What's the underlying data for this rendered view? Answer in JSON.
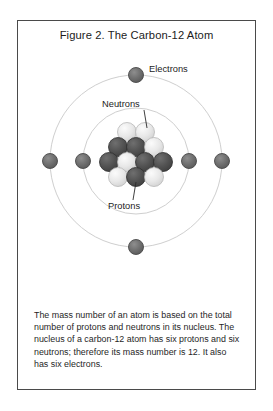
{
  "figure": {
    "title": "Figure 2. The Carbon-12 Atom",
    "caption": "The mass number of an atom is based on the total number of protons and neutrons in its nucleus. The nucleus of a carbon-12 atom has six protons and six neutrons; therefore its mass number is 12. It also has six electrons.",
    "border_color": "#4a4a4a",
    "background_color": "#ffffff"
  },
  "labels": {
    "electrons": "Electrons",
    "neutrons": "Neutrons",
    "protons": "Protons"
  },
  "colors": {
    "orbit_ring": "#cfcfcf",
    "electron": "#6b6b6b",
    "proton": "#4f4f4f",
    "neutron": "#e2e2e2",
    "text": "#1c1c1c",
    "leader_line": "#2b2b2b"
  },
  "atom": {
    "center": {
      "x": 118,
      "y": 112
    },
    "orbits": [
      {
        "name": "inner-orbit",
        "radius": 53
      },
      {
        "name": "outer-orbit",
        "radius": 86
      }
    ],
    "electron_count": 6,
    "proton_count": 6,
    "neutron_count": 6,
    "electrons": [
      {
        "name": "electron-outer-top",
        "x": 118,
        "y": 26,
        "r": 7.5
      },
      {
        "name": "electron-outer-bottom",
        "x": 118,
        "y": 198,
        "r": 7.5
      },
      {
        "name": "electron-outer-left",
        "x": 32,
        "y": 112,
        "r": 7.5
      },
      {
        "name": "electron-outer-right",
        "x": 204,
        "y": 112,
        "r": 7.5
      },
      {
        "name": "electron-inner-left",
        "x": 65,
        "y": 112,
        "r": 7.5
      },
      {
        "name": "electron-inner-right",
        "x": 171,
        "y": 112,
        "r": 7.5
      }
    ],
    "nucleus_particles": [
      {
        "name": "neutron",
        "x": 109,
        "y": 83,
        "r": 9.5,
        "type": "neutron"
      },
      {
        "name": "neutron",
        "x": 127,
        "y": 83,
        "r": 9.5,
        "type": "neutron"
      },
      {
        "name": "proton",
        "x": 100,
        "y": 98,
        "r": 9.5,
        "type": "proton"
      },
      {
        "name": "proton",
        "x": 118,
        "y": 98,
        "r": 9.5,
        "type": "proton"
      },
      {
        "name": "neutron",
        "x": 136,
        "y": 98,
        "r": 9.5,
        "type": "neutron"
      },
      {
        "name": "proton",
        "x": 91,
        "y": 113,
        "r": 9.5,
        "type": "proton"
      },
      {
        "name": "neutron",
        "x": 109,
        "y": 113,
        "r": 9.5,
        "type": "neutron"
      },
      {
        "name": "proton",
        "x": 127,
        "y": 113,
        "r": 9.5,
        "type": "proton"
      },
      {
        "name": "proton",
        "x": 145,
        "y": 113,
        "r": 9.5,
        "type": "proton"
      },
      {
        "name": "neutron",
        "x": 100,
        "y": 128,
        "r": 9.5,
        "type": "neutron"
      },
      {
        "name": "proton",
        "x": 118,
        "y": 128,
        "r": 9.5,
        "type": "proton"
      },
      {
        "name": "neutron",
        "x": 136,
        "y": 128,
        "r": 9.5,
        "type": "neutron"
      }
    ]
  }
}
